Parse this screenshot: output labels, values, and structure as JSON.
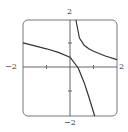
{
  "chart_data": {
    "type": "line",
    "title": "",
    "xlabel": "",
    "ylabel": "",
    "xlim": [
      -2,
      2
    ],
    "ylim": [
      -2,
      2
    ],
    "grid": false,
    "ticks": {
      "x": [
        -1,
        1
      ],
      "y": [
        -1,
        1
      ]
    },
    "tick_labels": {
      "x_left": "−2",
      "x_right": "2",
      "y_top": "2",
      "y_bottom": "−2"
    },
    "series": [
      {
        "name": "branch-left",
        "x": [
          -2,
          -1,
          -0.5,
          0,
          0.35,
          0.6,
          0.8,
          1.05
        ],
        "y": [
          1.05,
          0.8,
          0.65,
          0.45,
          0,
          -0.6,
          -1.2,
          -2
        ]
      },
      {
        "name": "branch-right",
        "x": [
          0.25,
          0.4,
          0.6,
          0.8,
          1.0,
          1.5,
          2.0
        ],
        "y": [
          2,
          1.25,
          0.95,
          0.8,
          0.7,
          0.5,
          0.35
        ]
      }
    ]
  },
  "labels": {
    "x_min": "−2",
    "x_max": "2",
    "y_max": "2",
    "y_min": "−2"
  }
}
